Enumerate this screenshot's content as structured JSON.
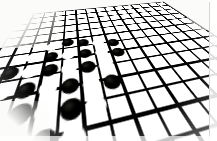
{
  "image": {
    "title": "Go board with stones in perspective",
    "subject": "goban",
    "style": "high-contrast black and white photograph",
    "background_color": "#fbfbf9",
    "line_color": "#1a1a18",
    "black_stone_color": "#111110",
    "white_stone_color": "#fafaf6",
    "view": "oblique perspective from above and in front",
    "grid": {
      "columns": 17,
      "rows": 17,
      "spacing_units": 17.5,
      "rotate_x_deg": 66,
      "rotate_z_deg": -13
    }
  },
  "board": {
    "label": "go-board",
    "stones": [
      {
        "name": "stone-1",
        "color": "black",
        "x": 111,
        "y": 96,
        "size": 14
      },
      {
        "name": "stone-2",
        "color": "white",
        "x": 93,
        "y": 100,
        "size": 14
      },
      {
        "name": "stone-3",
        "color": "black",
        "x": 129,
        "y": 100,
        "size": 14
      },
      {
        "name": "stone-4",
        "color": "white",
        "x": 147,
        "y": 104,
        "size": 14
      },
      {
        "name": "stone-5",
        "color": "black",
        "x": 165,
        "y": 108,
        "size": 14
      },
      {
        "name": "stone-6",
        "color": "white",
        "x": 76,
        "y": 114,
        "size": 14
      },
      {
        "name": "stone-7",
        "color": "black",
        "x": 94,
        "y": 117,
        "size": 14
      },
      {
        "name": "stone-8",
        "color": "white",
        "x": 112,
        "y": 118,
        "size": 14
      },
      {
        "name": "stone-9",
        "color": "black",
        "x": 130,
        "y": 120,
        "size": 14
      },
      {
        "name": "stone-10",
        "color": "white",
        "x": 148,
        "y": 122,
        "size": 14
      },
      {
        "name": "stone-11",
        "color": "black",
        "x": 166,
        "y": 126,
        "size": 14
      },
      {
        "name": "stone-12",
        "color": "black",
        "x": 59,
        "y": 132,
        "size": 15
      },
      {
        "name": "stone-13",
        "color": "white",
        "x": 77,
        "y": 134,
        "size": 15
      },
      {
        "name": "stone-14",
        "color": "black",
        "x": 95,
        "y": 136,
        "size": 15
      },
      {
        "name": "stone-15",
        "color": "white",
        "x": 113,
        "y": 138,
        "size": 15
      },
      {
        "name": "stone-16",
        "color": "black",
        "x": 131,
        "y": 140,
        "size": 15
      },
      {
        "name": "stone-17",
        "color": "white",
        "x": 149,
        "y": 142,
        "size": 15
      },
      {
        "name": "stone-18",
        "color": "white",
        "x": 60,
        "y": 152,
        "size": 15
      },
      {
        "name": "stone-19",
        "color": "black",
        "x": 78,
        "y": 154,
        "size": 15
      },
      {
        "name": "stone-20",
        "color": "white",
        "x": 96,
        "y": 156,
        "size": 15
      },
      {
        "name": "stone-21",
        "color": "black",
        "x": 114,
        "y": 158,
        "size": 15
      },
      {
        "name": "stone-22",
        "color": "white",
        "x": 132,
        "y": 160,
        "size": 15
      },
      {
        "name": "stone-23",
        "color": "black",
        "x": 150,
        "y": 162,
        "size": 15
      },
      {
        "name": "stone-24",
        "color": "black",
        "x": 43,
        "y": 170,
        "size": 16
      },
      {
        "name": "stone-25",
        "color": "white",
        "x": 61,
        "y": 172,
        "size": 16
      },
      {
        "name": "stone-26",
        "color": "black",
        "x": 79,
        "y": 174,
        "size": 16
      },
      {
        "name": "stone-27",
        "color": "white",
        "x": 97,
        "y": 176,
        "size": 16
      },
      {
        "name": "stone-28",
        "color": "black",
        "x": 115,
        "y": 178,
        "size": 16
      },
      {
        "name": "stone-29",
        "color": "white",
        "x": 133,
        "y": 180,
        "size": 16
      },
      {
        "name": "stone-30",
        "color": "white",
        "x": 44,
        "y": 190,
        "size": 16
      },
      {
        "name": "stone-31",
        "color": "black",
        "x": 62,
        "y": 192,
        "size": 16
      },
      {
        "name": "stone-32",
        "color": "white",
        "x": 80,
        "y": 194,
        "size": 16
      },
      {
        "name": "stone-33",
        "color": "black",
        "x": 98,
        "y": 196,
        "size": 16
      },
      {
        "name": "stone-34",
        "color": "white",
        "x": 116,
        "y": 198,
        "size": 16
      },
      {
        "name": "stone-35",
        "color": "black",
        "x": 81,
        "y": 214,
        "size": 17
      },
      {
        "name": "stone-36",
        "color": "white",
        "x": 63,
        "y": 212,
        "size": 17
      },
      {
        "name": "stone-37",
        "color": "white",
        "x": 99,
        "y": 216,
        "size": 17
      }
    ]
  }
}
